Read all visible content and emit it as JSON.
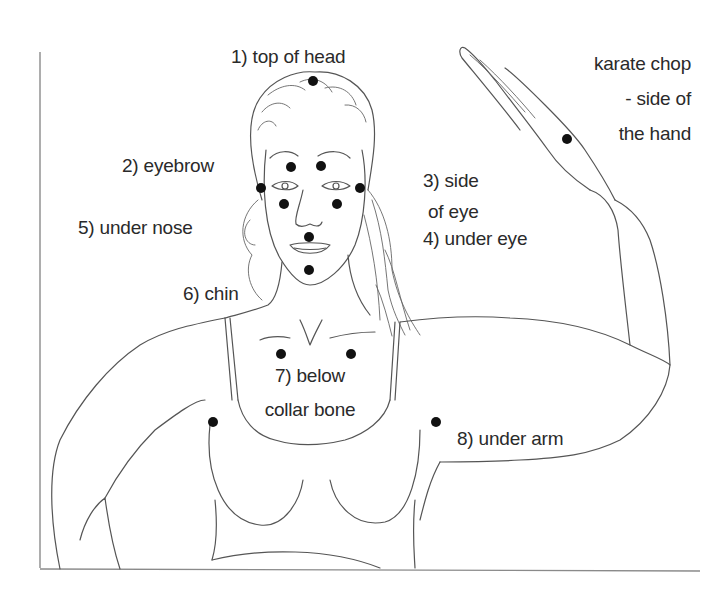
{
  "diagram": {
    "colors": {
      "background": "#ffffff",
      "line": "#555555",
      "dot": "#111111",
      "text": "#2a2a2a"
    },
    "labels": {
      "top_of_head": "1) top of head",
      "eyebrow": "2) eyebrow",
      "side_of_eye_1": "3) side",
      "side_of_eye_2": "of eye",
      "under_eye": "4) under eye",
      "under_nose": "5) under nose",
      "chin": "6) chin",
      "collar_bone_1": "7) below",
      "collar_bone_2": "collar bone",
      "under_arm": "8) under arm",
      "karate_chop_1": "karate chop",
      "karate_chop_2": "- side of",
      "karate_chop_3": "the hand"
    },
    "points": [
      {
        "name": "top-of-head",
        "x": 313,
        "y": 81
      },
      {
        "name": "eyebrow-left",
        "x": 291,
        "y": 167
      },
      {
        "name": "eyebrow-right",
        "x": 321,
        "y": 166
      },
      {
        "name": "side-of-eye-left",
        "x": 261,
        "y": 188
      },
      {
        "name": "side-of-eye-right",
        "x": 360,
        "y": 188
      },
      {
        "name": "under-eye-left",
        "x": 284,
        "y": 204
      },
      {
        "name": "under-eye-right",
        "x": 337,
        "y": 204
      },
      {
        "name": "under-nose",
        "x": 309,
        "y": 237
      },
      {
        "name": "chin",
        "x": 309,
        "y": 270
      },
      {
        "name": "collar-bone-left",
        "x": 281,
        "y": 354
      },
      {
        "name": "collar-bone-right",
        "x": 351,
        "y": 354
      },
      {
        "name": "under-arm-left",
        "x": 213,
        "y": 422
      },
      {
        "name": "under-arm-right",
        "x": 436,
        "y": 422
      },
      {
        "name": "karate-chop",
        "x": 567,
        "y": 139
      }
    ]
  }
}
